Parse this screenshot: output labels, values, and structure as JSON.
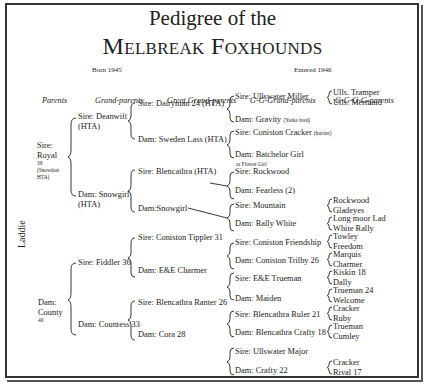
{
  "title": {
    "line1": "Pedigree of the",
    "line2": "Melbreak Foxhounds"
  },
  "born": "Born 1945",
  "entered": "Entered 1946",
  "headers": [
    "Parents",
    "Grand-parents",
    "Great Grand-parents",
    "G-G-Grand-parents",
    "G-G-G-G-parents"
  ],
  "subject": "Laddie",
  "parents": {
    "sire": {
      "l1": "Sire:",
      "l2": "Royal",
      "l3": "39",
      "l4": "(Snowdon",
      "l5": "HTA)"
    },
    "dam": {
      "l1": "Dam:",
      "l2": "County",
      "l3": "40"
    }
  },
  "grandparents": {
    "ss": {
      "l1": "Sire: Deanwift",
      "l2": "(HTA)"
    },
    "sd": {
      "l1": "Dam: Snowgirl",
      "l2": "(HTA)"
    },
    "ds": {
      "l1": "Sire: Fiddler 36"
    },
    "dd": {
      "l1": "Dam: Countess 33"
    }
  },
  "great_grandparents": [
    "Sire: Dairyman 24 (HTA)",
    "Dam: Sweden Lass (HTA)",
    "Sire: Blencathra (HTA)",
    "Dam:Snowgirl",
    "Sire: Coniston Tippler 31",
    "Dam: E&E Charmer",
    "Sire: Blencathra Ranter 26",
    "Dam: Cora 28"
  ],
  "gg_grandparents": [
    {
      "label": "Sire: Ullswater Miller"
    },
    {
      "label": "Dam: Gravity",
      "note": "(Yorks bred)"
    },
    {
      "label": "Sire: Coniston Cracker",
      "note": "(harrier)"
    },
    {
      "label": "Dam: Batchelor Girl",
      "sub": "or Flower Girl"
    },
    {
      "label": "Sire: Rockwood"
    },
    {
      "label": "Dam: Fearless (2)"
    },
    {
      "label": "Sire: Mountain"
    },
    {
      "label": "Dam: Rally White"
    },
    {
      "label": "Sire: Coniston Friendship"
    },
    {
      "label": "Dam: Coniston Trilby 26"
    },
    {
      "label": "Sire: E&E Trueman"
    },
    {
      "label": "Dam: Maiden"
    },
    {
      "label": "Sire: Blencathra Ruler 21"
    },
    {
      "label": "Dam: Blencathra Crafty 18"
    },
    {
      "label": "Sire: Ullswater Major"
    },
    {
      "label": "Dam: Crafty 22"
    }
  ],
  "ggg_grandparents": [
    [
      "Ulls. Tramper",
      "Ulls. Mermaid"
    ],
    [
      "Rockwood",
      "Gladeyes"
    ],
    [
      "Long moor Lad",
      "White Rally"
    ],
    [
      "Towley",
      "Freedom"
    ],
    [
      "Marquis",
      "Charmer"
    ],
    [
      "Kiskin 18",
      "Dally"
    ],
    [
      "Trueman 24",
      "Welcome"
    ],
    [
      "Cracker",
      "Ruby"
    ],
    [
      "Trueman",
      "Cumley"
    ],
    [
      "Cracker",
      "Rival 17"
    ]
  ]
}
